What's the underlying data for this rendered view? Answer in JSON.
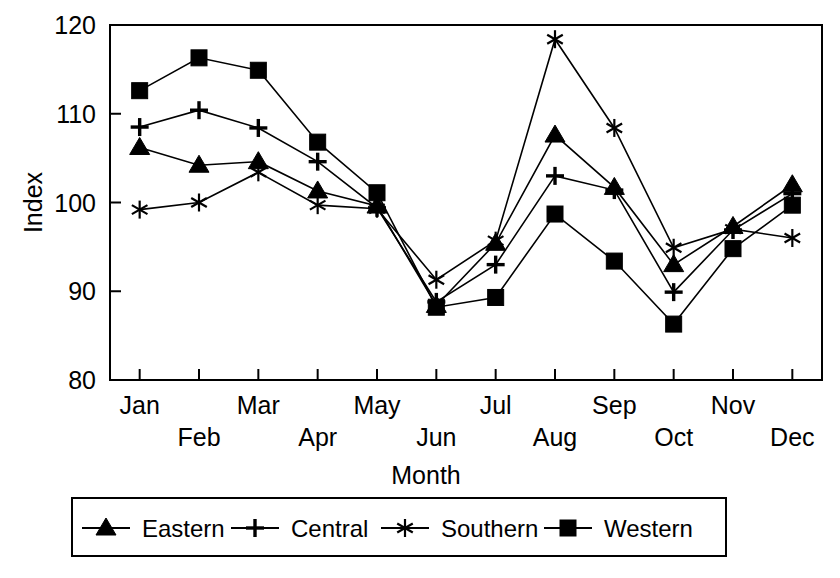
{
  "chart_data": {
    "type": "line",
    "title": "",
    "subtitle": "",
    "xlabel": "Month",
    "ylabel": "Index",
    "categories": [
      "Jan",
      "Feb",
      "Mar",
      "Apr",
      "May",
      "Jun",
      "Jul",
      "Aug",
      "Sep",
      "Oct",
      "Nov",
      "Dec"
    ],
    "x_tick_labels": [
      "Jan",
      "Feb",
      "Mar",
      "Apr",
      "May",
      "Jun",
      "Jul",
      "Aug",
      "Sep",
      "Oct",
      "Nov",
      "Dec"
    ],
    "y_tick_labels": [
      "80",
      "90",
      "100",
      "110",
      "120"
    ],
    "y_ticks": [
      80,
      90,
      100,
      110,
      120
    ],
    "ylim": [
      80,
      120
    ],
    "grid": false,
    "legend_position": "bottom",
    "legend_entries": [
      "Eastern",
      "Central",
      "Southern",
      "Western"
    ],
    "series": [
      {
        "name": "Eastern",
        "marker": "triangle",
        "values": [
          106.2,
          104.2,
          104.6,
          101.3,
          99.6,
          88.4,
          95.4,
          107.6,
          101.7,
          93.0,
          97.3,
          102.0
        ]
      },
      {
        "name": "Central",
        "marker": "plus",
        "values": [
          108.5,
          110.4,
          108.4,
          104.6,
          99.4,
          88.8,
          93.0,
          103.0,
          101.4,
          89.9,
          96.9,
          101.0
        ]
      },
      {
        "name": "Southern",
        "marker": "asterisk",
        "values": [
          99.2,
          100.0,
          103.4,
          99.7,
          99.3,
          91.3,
          95.7,
          118.4,
          108.4,
          94.9,
          97.0,
          96.0
        ]
      },
      {
        "name": "Western",
        "marker": "square",
        "values": [
          112.6,
          116.3,
          114.9,
          106.8,
          101.1,
          88.2,
          89.3,
          98.7,
          93.4,
          86.3,
          94.8,
          99.7
        ]
      }
    ]
  },
  "legend": {
    "items": [
      {
        "label": "Eastern",
        "marker": "triangle"
      },
      {
        "label": "Central",
        "marker": "plus"
      },
      {
        "label": "Southern",
        "marker": "asterisk"
      },
      {
        "label": "Western",
        "marker": "square"
      }
    ]
  },
  "axes": {
    "y_axis_title": "Index",
    "x_axis_title": "Month"
  }
}
